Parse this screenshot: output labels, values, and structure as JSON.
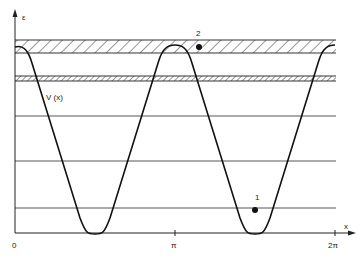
{
  "diagram": {
    "type": "potential-energy-diagram",
    "axes": {
      "y_label": "ε",
      "x_label": "x",
      "x_ticks": [
        "0",
        "π",
        "2π"
      ]
    },
    "curve_label": "V (x)",
    "points": [
      {
        "id": "point-1",
        "label": "1"
      },
      {
        "id": "point-2",
        "label": "2"
      }
    ],
    "bands": [
      {
        "name": "upper-hatched-band",
        "style": "wide-hatched"
      },
      {
        "name": "lower-hatched-band",
        "style": "narrow-hatched"
      }
    ],
    "levels": [
      "level-1",
      "level-2",
      "level-3"
    ],
    "colors": {
      "line": "#222222",
      "background": "#ffffff"
    }
  }
}
